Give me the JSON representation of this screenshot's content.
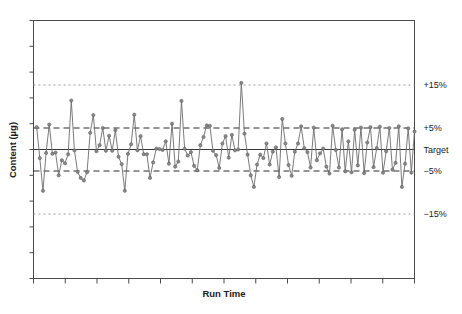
{
  "chart_data": {
    "type": "line",
    "title": "",
    "subtitle": "",
    "xlabel": "Run Time",
    "ylabel": "Content (µg)",
    "grid": false,
    "legend_position": "none",
    "x_tick_labels": [],
    "y_tick_labels": [],
    "x_major_tick_count": 13,
    "y_major_tick_count": 11,
    "ylim": [
      -30,
      30
    ],
    "xlim": [
      0,
      121
    ],
    "annotations": [
      {
        "name": "plus-fifteen",
        "label": "+15%",
        "value": 15,
        "style": "dotted",
        "color": "#9a9a9a"
      },
      {
        "name": "plus-five",
        "label": "+5%",
        "value": 5,
        "style": "dashed",
        "color": "#2b2b2b"
      },
      {
        "name": "target",
        "label": "Target",
        "value": 0,
        "style": "solid",
        "color": "#3a3a3a"
      },
      {
        "name": "minus-five",
        "label": "−5%",
        "value": -5,
        "style": "dashed",
        "color": "#2b2b2b"
      },
      {
        "name": "minus-fifteen",
        "label": "−15%",
        "value": -15,
        "style": "dotted",
        "color": "#9a9a9a"
      }
    ],
    "series": [
      {
        "name": "content",
        "color": "#6b6b6b",
        "marker": "circle",
        "x": [
          1,
          2,
          3,
          4,
          5,
          6,
          7,
          8,
          9,
          10,
          11,
          12,
          13,
          14,
          15,
          16,
          17,
          18,
          19,
          20,
          21,
          22,
          23,
          24,
          25,
          26,
          27,
          28,
          29,
          30,
          31,
          32,
          33,
          34,
          35,
          36,
          37,
          38,
          39,
          40,
          41,
          42,
          43,
          44,
          45,
          46,
          47,
          48,
          49,
          50,
          51,
          52,
          53,
          54,
          55,
          56,
          57,
          58,
          59,
          60,
          61,
          62,
          63,
          64,
          65,
          66,
          67,
          68,
          69,
          70,
          71,
          72,
          73,
          74,
          75,
          76,
          77,
          78,
          79,
          80,
          81,
          82,
          83,
          84,
          85,
          86,
          87,
          88,
          89,
          90,
          91,
          92,
          93,
          94,
          95,
          96,
          97,
          98,
          99,
          100,
          101,
          102,
          103,
          104,
          105,
          106,
          107,
          108,
          109,
          110,
          111,
          112,
          113,
          114,
          115,
          116,
          117,
          118,
          119,
          120,
          121
        ],
        "values": [
          5.2,
          -2.0,
          -9.6,
          -0.8,
          5.8,
          -1.0,
          -0.7,
          -6.0,
          -2.5,
          -3.2,
          -1.1,
          11.4,
          -0.2,
          -5.2,
          -6.6,
          -7.2,
          -5.3,
          3.9,
          8.0,
          -0.4,
          1.0,
          5.0,
          -0.3,
          3.2,
          -0.3,
          4.5,
          -1.7,
          -3.4,
          -9.6,
          -1.0,
          1.2,
          8.1,
          -0.2,
          3.1,
          -1.1,
          -1.1,
          -6.6,
          -3.0,
          0.2,
          0.1,
          -0.1,
          1.9,
          -3.3,
          6.0,
          -4.0,
          -2.8,
          11.3,
          0.2,
          -1.4,
          -0.6,
          -3.8,
          -4.8,
          1.0,
          2.9,
          5.6,
          5.5,
          -0.3,
          -1.3,
          -4.3,
          1.4,
          3.1,
          -1.9,
          3.4,
          -0.2,
          0.0,
          15.5,
          3.7,
          -1.2,
          -6.0,
          -8.7,
          -3.5,
          -1.2,
          -2.0,
          1.4,
          -3.5,
          -0.5,
          0.5,
          -6.4,
          7.1,
          1.4,
          -3.6,
          -6.1,
          -0.5,
          1.4,
          5.4,
          0.3,
          -0.6,
          -4.2,
          5.1,
          -2.5,
          -0.9,
          0.2,
          -4.0,
          -5.6,
          5.5,
          -0.1,
          -4.2,
          4.7,
          -5.1,
          1.9,
          -5.3,
          4.6,
          -3.7,
          5.1,
          -5.5,
          1.6,
          5.2,
          -4.1,
          0.3,
          5.3,
          -5.4,
          -0.4,
          5.0,
          -4.7,
          -3.1,
          5.4,
          -8.7,
          -3.3,
          4.9,
          -5.4,
          4.2
        ]
      }
    ]
  }
}
